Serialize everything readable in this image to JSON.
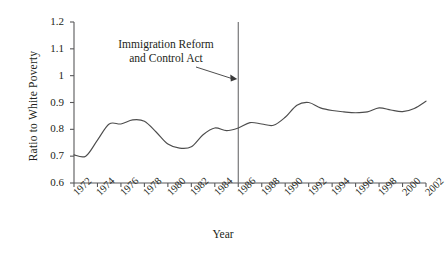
{
  "chart_data": {
    "type": "line",
    "title": "",
    "xlabel": "Year",
    "ylabel": "Ratio to White Poverty",
    "xlim": [
      1972,
      2002
    ],
    "ylim": [
      0.6,
      1.2
    ],
    "grid": false,
    "legend": null,
    "ytick_labels": [
      "1.2",
      "1.1",
      "1",
      "0.9",
      "0.8",
      "0.7",
      "0.6"
    ],
    "ytick_values": [
      1.2,
      1.1,
      1.0,
      0.9,
      0.8,
      0.7,
      0.6
    ],
    "xtick_labels": [
      "1972",
      "1974",
      "1976",
      "1978",
      "1980",
      "1982",
      "1984",
      "1986",
      "1988",
      "1990",
      "1992",
      "1994",
      "1996",
      "1998",
      "2000",
      "2002"
    ],
    "xtick_values": [
      1972,
      1974,
      1976,
      1978,
      1980,
      1982,
      1984,
      1986,
      1988,
      1990,
      1992,
      1994,
      1996,
      1998,
      2000,
      2002
    ],
    "line_color": "#4d4d4d",
    "x": [
      1972,
      1973,
      1974,
      1975,
      1976,
      1977,
      1978,
      1979,
      1980,
      1981,
      1982,
      1983,
      1984,
      1985,
      1986,
      1987,
      1988,
      1989,
      1990,
      1991,
      1992,
      1993,
      1994,
      1995,
      1996,
      1997,
      1998,
      1999,
      2000,
      2001,
      2002
    ],
    "values": [
      0.705,
      0.7,
      0.76,
      0.82,
      0.82,
      0.835,
      0.83,
      0.79,
      0.745,
      0.73,
      0.735,
      0.78,
      0.805,
      0.795,
      0.805,
      0.825,
      0.82,
      0.815,
      0.845,
      0.89,
      0.9,
      0.88,
      0.87,
      0.865,
      0.862,
      0.865,
      0.88,
      0.872,
      0.866,
      0.878,
      0.905
    ],
    "annotations": [
      {
        "name": "immigration-reform-and-control-act",
        "text_line1": "Immigration Reform",
        "text_line2": "and Control Act",
        "target_year": 1986,
        "marker": "vertical-line-with-arrow"
      }
    ]
  }
}
